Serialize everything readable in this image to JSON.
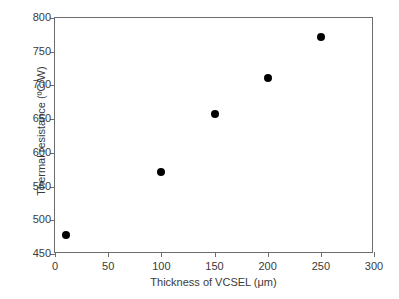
{
  "chart_data": {
    "type": "scatter",
    "title": "",
    "xlabel": "Thickness of VCSEL (μm)",
    "ylabel": "Thermal resistance (ºC/W)",
    "xlim": [
      0,
      300
    ],
    "ylim": [
      450,
      800
    ],
    "xticks": [
      0,
      50,
      100,
      150,
      200,
      250,
      300
    ],
    "xtick_labels": [
      "0",
      "50",
      "100",
      "150",
      "200",
      "250",
      "300"
    ],
    "yticks": [
      450,
      500,
      550,
      600,
      650,
      700,
      750,
      800
    ],
    "ytick_labels": [
      "450",
      "500",
      "550",
      "600",
      "650",
      "700",
      "750",
      "800"
    ],
    "grid": false,
    "legend": null,
    "marker": "filled-circle",
    "marker_color": "#000000",
    "series": [
      {
        "name": "Thermal resistance vs thickness",
        "x": [
          10,
          100,
          150,
          200,
          250
        ],
        "y": [
          478,
          572,
          657,
          711,
          772
        ]
      }
    ]
  },
  "figure": {
    "background_color": "#ffffff",
    "axis_color": "#6d6d6d",
    "text_color": "#3a3a3a"
  }
}
